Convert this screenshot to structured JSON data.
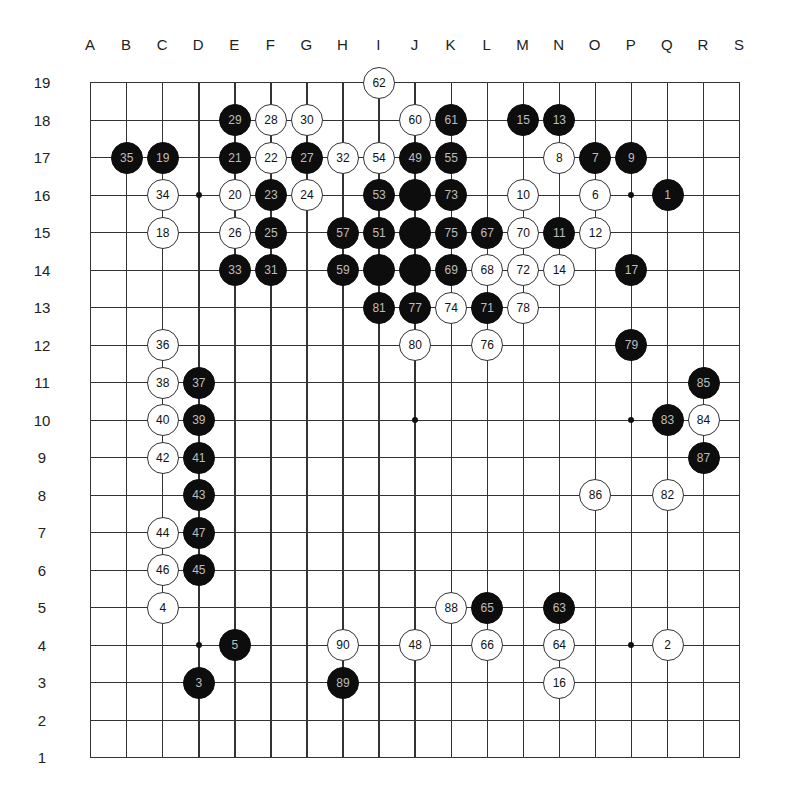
{
  "board": {
    "size": 19,
    "columns": [
      "A",
      "B",
      "C",
      "D",
      "E",
      "F",
      "G",
      "H",
      "I",
      "J",
      "K",
      "L",
      "M",
      "N",
      "O",
      "P",
      "Q",
      "R",
      "S"
    ],
    "rows": [
      19,
      18,
      17,
      16,
      15,
      14,
      13,
      12,
      11,
      10,
      9,
      8,
      7,
      6,
      5,
      4,
      3,
      2,
      1
    ],
    "colors": {
      "black_stone": "#0d0d0d",
      "white_stone": "#ffffff",
      "grid": "#333333",
      "black_number": "#bdbdbd",
      "white_number": "#111111"
    },
    "star_points": [
      "D16",
      "P16",
      "J10",
      "P10",
      "D4",
      "P4"
    ],
    "stones": [
      {
        "pos": "I19",
        "color": "white",
        "num": "62"
      },
      {
        "pos": "E18",
        "color": "black",
        "num": "29"
      },
      {
        "pos": "F18",
        "color": "white",
        "num": "28"
      },
      {
        "pos": "G18",
        "color": "white",
        "num": "30"
      },
      {
        "pos": "J18",
        "color": "white",
        "num": "60"
      },
      {
        "pos": "K18",
        "color": "black",
        "num": "61"
      },
      {
        "pos": "M18",
        "color": "black",
        "num": "15"
      },
      {
        "pos": "N18",
        "color": "black",
        "num": "13"
      },
      {
        "pos": "B17",
        "color": "black",
        "num": "35"
      },
      {
        "pos": "C17",
        "color": "black",
        "num": "19"
      },
      {
        "pos": "E17",
        "color": "black",
        "num": "21"
      },
      {
        "pos": "F17",
        "color": "white",
        "num": "22"
      },
      {
        "pos": "G17",
        "color": "black",
        "num": "27"
      },
      {
        "pos": "H17",
        "color": "white",
        "num": "32"
      },
      {
        "pos": "I17",
        "color": "white",
        "num": "54"
      },
      {
        "pos": "J17",
        "color": "black",
        "num": "49"
      },
      {
        "pos": "K17",
        "color": "black",
        "num": "55"
      },
      {
        "pos": "N17",
        "color": "white",
        "num": "8"
      },
      {
        "pos": "O17",
        "color": "black",
        "num": "7"
      },
      {
        "pos": "P17",
        "color": "black",
        "num": "9"
      },
      {
        "pos": "C16",
        "color": "white",
        "num": "34"
      },
      {
        "pos": "E16",
        "color": "white",
        "num": "20"
      },
      {
        "pos": "F16",
        "color": "black",
        "num": "23"
      },
      {
        "pos": "G16",
        "color": "white",
        "num": "24"
      },
      {
        "pos": "I16",
        "color": "black",
        "num": "53"
      },
      {
        "pos": "J16",
        "color": "black",
        "num": ""
      },
      {
        "pos": "K16",
        "color": "black",
        "num": "73"
      },
      {
        "pos": "M16",
        "color": "white",
        "num": "10"
      },
      {
        "pos": "O16",
        "color": "white",
        "num": "6"
      },
      {
        "pos": "Q16",
        "color": "black",
        "num": "1"
      },
      {
        "pos": "C15",
        "color": "white",
        "num": "18"
      },
      {
        "pos": "E15",
        "color": "white",
        "num": "26"
      },
      {
        "pos": "F15",
        "color": "black",
        "num": "25"
      },
      {
        "pos": "H15",
        "color": "black",
        "num": "57"
      },
      {
        "pos": "I15",
        "color": "black",
        "num": "51"
      },
      {
        "pos": "J15",
        "color": "black",
        "num": ""
      },
      {
        "pos": "K15",
        "color": "black",
        "num": "75"
      },
      {
        "pos": "L15",
        "color": "black",
        "num": "67"
      },
      {
        "pos": "M15",
        "color": "white",
        "num": "70"
      },
      {
        "pos": "N15",
        "color": "black",
        "num": "11"
      },
      {
        "pos": "O15",
        "color": "white",
        "num": "12"
      },
      {
        "pos": "E14",
        "color": "black",
        "num": "33"
      },
      {
        "pos": "F14",
        "color": "black",
        "num": "31"
      },
      {
        "pos": "H14",
        "color": "black",
        "num": "59"
      },
      {
        "pos": "I14",
        "color": "black",
        "num": ""
      },
      {
        "pos": "J14",
        "color": "black",
        "num": ""
      },
      {
        "pos": "K14",
        "color": "black",
        "num": "69"
      },
      {
        "pos": "L14",
        "color": "white",
        "num": "68"
      },
      {
        "pos": "M14",
        "color": "white",
        "num": "72"
      },
      {
        "pos": "N14",
        "color": "white",
        "num": "14"
      },
      {
        "pos": "P14",
        "color": "black",
        "num": "17"
      },
      {
        "pos": "I13",
        "color": "black",
        "num": "81"
      },
      {
        "pos": "J13",
        "color": "black",
        "num": "77"
      },
      {
        "pos": "K13",
        "color": "white",
        "num": "74"
      },
      {
        "pos": "L13",
        "color": "black",
        "num": "71"
      },
      {
        "pos": "M13",
        "color": "white",
        "num": "78"
      },
      {
        "pos": "C12",
        "color": "white",
        "num": "36"
      },
      {
        "pos": "J12",
        "color": "white",
        "num": "80"
      },
      {
        "pos": "L12",
        "color": "white",
        "num": "76"
      },
      {
        "pos": "P12",
        "color": "black",
        "num": "79"
      },
      {
        "pos": "C11",
        "color": "white",
        "num": "38"
      },
      {
        "pos": "D11",
        "color": "black",
        "num": "37"
      },
      {
        "pos": "R11",
        "color": "black",
        "num": "85"
      },
      {
        "pos": "C10",
        "color": "white",
        "num": "40"
      },
      {
        "pos": "D10",
        "color": "black",
        "num": "39"
      },
      {
        "pos": "Q10",
        "color": "black",
        "num": "83"
      },
      {
        "pos": "R10",
        "color": "white",
        "num": "84"
      },
      {
        "pos": "C9",
        "color": "white",
        "num": "42"
      },
      {
        "pos": "D9",
        "color": "black",
        "num": "41"
      },
      {
        "pos": "R9",
        "color": "black",
        "num": "87"
      },
      {
        "pos": "D8",
        "color": "black",
        "num": "43"
      },
      {
        "pos": "O8",
        "color": "white",
        "num": "86"
      },
      {
        "pos": "Q8",
        "color": "white",
        "num": "82"
      },
      {
        "pos": "C7",
        "color": "white",
        "num": "44"
      },
      {
        "pos": "D7",
        "color": "black",
        "num": "47"
      },
      {
        "pos": "C6",
        "color": "white",
        "num": "46"
      },
      {
        "pos": "D6",
        "color": "black",
        "num": "45"
      },
      {
        "pos": "C5",
        "color": "white",
        "num": "4"
      },
      {
        "pos": "K5",
        "color": "white",
        "num": "88"
      },
      {
        "pos": "L5",
        "color": "black",
        "num": "65"
      },
      {
        "pos": "N5",
        "color": "black",
        "num": "63"
      },
      {
        "pos": "E4",
        "color": "black",
        "num": "5"
      },
      {
        "pos": "H4",
        "color": "white",
        "num": "90"
      },
      {
        "pos": "J4",
        "color": "white",
        "num": "48"
      },
      {
        "pos": "L4",
        "color": "white",
        "num": "66"
      },
      {
        "pos": "N4",
        "color": "white",
        "num": "64"
      },
      {
        "pos": "Q4",
        "color": "white",
        "num": "2"
      },
      {
        "pos": "D3",
        "color": "black",
        "num": "3"
      },
      {
        "pos": "H3",
        "color": "black",
        "num": "89"
      },
      {
        "pos": "N3",
        "color": "white",
        "num": "16"
      }
    ]
  }
}
